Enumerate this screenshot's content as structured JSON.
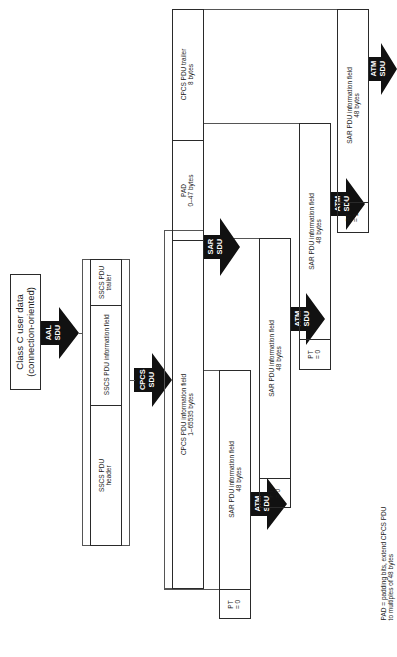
{
  "source_box": {
    "line1": "Class C user data",
    "line2": "(connection-oriented)"
  },
  "arrows": {
    "aal_sdu": {
      "line1": "AAL",
      "line2": "SDU"
    },
    "cpcs_sdu": {
      "line1": "CPCS",
      "line2": "SDU"
    },
    "sar_sdu": {
      "line1": "SAR",
      "line2": "SDU"
    },
    "atm_sdu": {
      "line1": "ATM",
      "line2": "SDU"
    }
  },
  "sscs_pdu": {
    "trailer": {
      "line1": "SSCS PDU",
      "line2": "trailer"
    },
    "info": "SSCS PDU information field",
    "header": {
      "line1": "SSCS PDU",
      "line2": "header"
    }
  },
  "cpcs_pdu": {
    "trailer": {
      "line1": "CPCS PDU trailer",
      "line2": "8 bytes"
    },
    "pad": {
      "line1": "PAD",
      "line2": "0–47 bytes"
    },
    "info": {
      "line1": "CPCS PDU information field",
      "line2": "1–65535 bytes"
    }
  },
  "sar_pdus": [
    {
      "info_line1": "SAR PDU information field",
      "info_line2": "48 bytes",
      "pt_line1": "PT",
      "pt_line2": "= 0"
    },
    {
      "info_line1": "SAR PDU information field",
      "info_line2": "48 bytes",
      "pt_line1": "PT",
      "pt_line2": "= 0"
    },
    {
      "info_line1": "SAR PDU information field",
      "info_line2": "48 bytes",
      "pt_line1": "PT",
      "pt_line2": "= 0"
    },
    {
      "info_line1": "SAR PDU information field",
      "info_line2": "48 bytes",
      "pt_line1": "PT",
      "pt_line2": "= 1"
    }
  ],
  "footnote": {
    "line1": "PAD = padding bits, extend CPCS PDU",
    "line2": "to multiples of 48 bytes"
  },
  "colors": {
    "line": "#2a2a2a",
    "arrow_fill": "#111111",
    "background": "#ffffff"
  }
}
